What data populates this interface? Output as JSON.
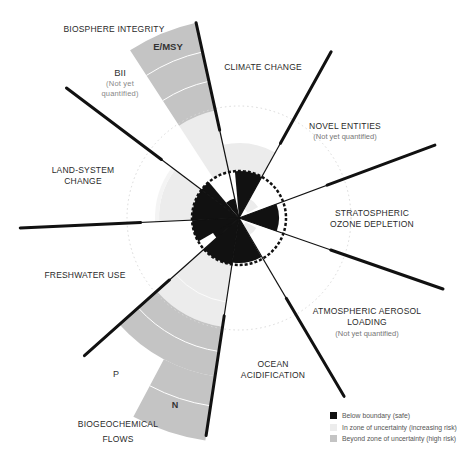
{
  "colors": {
    "safe": "#111111",
    "uncertainty": "#e8e8e8",
    "high_risk": "#c4c4c4",
    "line": "#111111"
  },
  "boundaries": [
    {
      "key": "climate",
      "label": "CLIMATE CHANGE"
    },
    {
      "key": "novel",
      "label": "NOVEL ENTITIES",
      "note": "(Not yet quantified)"
    },
    {
      "key": "ozone",
      "label_line1": "STRATOSPHERIC",
      "label_line2": "OZONE DEPLETION"
    },
    {
      "key": "aerosol",
      "label_line1": "ATMOSPHERIC AEROSOL",
      "label_line2": "LOADING",
      "note": "(Not yet quantified)"
    },
    {
      "key": "ocean",
      "label_line1": "OCEAN",
      "label_line2": "ACIDIFICATION"
    },
    {
      "key": "biogeo",
      "label_line1": "BIOGEOCHEMICAL",
      "label_line2": "FLOWS",
      "sub_p": "P",
      "sub_n": "N"
    },
    {
      "key": "freshwater",
      "label": "FRESHWATER USE"
    },
    {
      "key": "land",
      "label_line1": "LAND-SYSTEM",
      "label_line2": "CHANGE"
    },
    {
      "key": "biosphere",
      "label": "BIOSPHERE INTEGRITY",
      "sub_emsy": "E/MSY",
      "sub_bii": "BII",
      "bii_note_1": "(Not yet",
      "bii_note_2": "quantified)"
    }
  ],
  "legend": [
    {
      "label": "Below boundary (safe)",
      "color": "#111111"
    },
    {
      "label": "In zone of uncertainty (increasing risk)",
      "color": "#ececec"
    },
    {
      "label": "Beyond zone of uncertainty (high risk)",
      "color": "#c4c4c4"
    }
  ],
  "chart_data": {
    "type": "radial-bar",
    "center": [
      239,
      218
    ],
    "safe_boundary_radius": 47,
    "outer_uncertainty_radius": 112,
    "sectors": [
      {
        "name": "Climate change",
        "status": "zone of uncertainty"
      },
      {
        "name": "Novel entities",
        "status": "not yet quantified"
      },
      {
        "name": "Stratospheric ozone depletion",
        "status": "below boundary"
      },
      {
        "name": "Atmospheric aerosol loading",
        "status": "not yet quantified"
      },
      {
        "name": "Ocean acidification",
        "status": "below boundary"
      },
      {
        "name": "Biogeochemical flows P",
        "status": "beyond zone of uncertainty"
      },
      {
        "name": "Biogeochemical flows N",
        "status": "beyond zone of uncertainty"
      },
      {
        "name": "Freshwater use",
        "status": "below boundary"
      },
      {
        "name": "Land-system change",
        "status": "zone of uncertainty"
      },
      {
        "name": "Biosphere integrity E/MSY",
        "status": "beyond zone of uncertainty"
      },
      {
        "name": "Biosphere integrity BII",
        "status": "not yet quantified"
      }
    ]
  }
}
